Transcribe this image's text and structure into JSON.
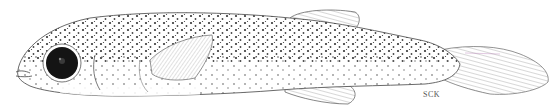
{
  "illustration": {
    "subject": "larval fish, lateral view, stippled pen-and-ink drawing",
    "signature": "SCK",
    "colors": {
      "background": "#ffffff",
      "ink": "#1a1a1a",
      "eye": "#111111",
      "stipple": "#3a3a3a"
    }
  }
}
